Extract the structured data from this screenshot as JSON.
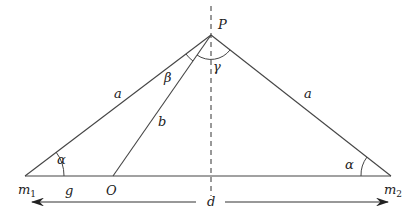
{
  "diagram": {
    "type": "geometry",
    "points": {
      "apex": {
        "label": "P"
      },
      "left_base": {
        "label": "m",
        "subscript": "1"
      },
      "right_base": {
        "label": "m",
        "subscript": "2"
      },
      "origin": {
        "label": "O"
      }
    },
    "segments": {
      "left_side": {
        "label": "a"
      },
      "right_side": {
        "label": "a"
      },
      "op": {
        "label": "b"
      },
      "m1_to_o": {
        "label": "g"
      },
      "distance": {
        "label": "d"
      }
    },
    "angles": {
      "left_base": {
        "label": "α"
      },
      "right_base": {
        "label": "α"
      },
      "beta": {
        "label": "β"
      },
      "gamma": {
        "label": "γ"
      }
    },
    "colors": {
      "line": "#333333",
      "text": "#222222"
    }
  }
}
